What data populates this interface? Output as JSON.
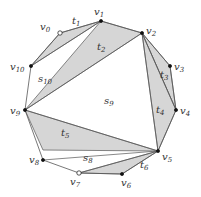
{
  "diagram": {
    "vertices": [
      {
        "id": "v0",
        "label": "v",
        "sub": "0",
        "x": 60,
        "y": 33,
        "open": true,
        "lx": 40,
        "ly": 30
      },
      {
        "id": "v1",
        "label": "v",
        "sub": "1",
        "x": 101,
        "y": 21,
        "open": false,
        "lx": 94,
        "ly": 15
      },
      {
        "id": "v2",
        "label": "v",
        "sub": "2",
        "x": 142,
        "y": 33,
        "open": false,
        "lx": 146,
        "ly": 34
      },
      {
        "id": "v3",
        "label": "v",
        "sub": "3",
        "x": 170,
        "y": 66,
        "open": false,
        "lx": 174,
        "ly": 70
      },
      {
        "id": "v4",
        "label": "v",
        "sub": "4",
        "x": 176,
        "y": 110,
        "open": false,
        "lx": 180,
        "ly": 114
      },
      {
        "id": "v5",
        "label": "v",
        "sub": "5",
        "x": 158,
        "y": 151,
        "open": false,
        "lx": 162,
        "ly": 160
      },
      {
        "id": "v6",
        "label": "v",
        "sub": "6",
        "x": 122,
        "y": 174,
        "open": false,
        "lx": 121,
        "ly": 186
      },
      {
        "id": "v7",
        "label": "v",
        "sub": "7",
        "x": 79,
        "y": 173,
        "open": true,
        "lx": 70,
        "ly": 185
      },
      {
        "id": "v8",
        "label": "v",
        "sub": "8",
        "x": 43,
        "y": 160,
        "open": false,
        "lx": 29,
        "ly": 163
      },
      {
        "id": "v9",
        "label": "v",
        "sub": "9",
        "x": 25,
        "y": 110,
        "open": false,
        "lx": 10,
        "ly": 114
      },
      {
        "id": "v10",
        "label": "v",
        "sub": "10",
        "x": 31,
        "y": 66,
        "open": false,
        "lx": 10,
        "ly": 70
      }
    ],
    "shaded_triangles": [
      {
        "name": "t1",
        "pts": "60,33 101,21 31,66",
        "label": "t",
        "sub": "1",
        "lx": 72,
        "ly": 24
      },
      {
        "name": "t2",
        "pts": "101,21 142,33 25,110",
        "label": "t",
        "sub": "2",
        "lx": 97,
        "ly": 50
      },
      {
        "name": "t3",
        "pts": "142,33 170,66 176,110",
        "label": "t",
        "sub": "3",
        "lx": 160,
        "ly": 78
      },
      {
        "name": "t4",
        "pts": "142,33 176,110 158,151",
        "label": "t",
        "sub": "4",
        "lx": 156,
        "ly": 113
      },
      {
        "name": "t5",
        "pts": "25,110 158,151 43,150",
        "label": "t",
        "sub": "5",
        "lx": 61,
        "ly": 136
      },
      {
        "name": "t6",
        "pts": "158,151 122,174 79,173",
        "label": "t",
        "sub": "6",
        "lx": 140,
        "ly": 168
      }
    ],
    "region_labels": [
      {
        "name": "s10",
        "label": "s",
        "sub": "10",
        "x": 38,
        "y": 82
      },
      {
        "name": "s9",
        "label": "s",
        "sub": "9",
        "x": 104,
        "y": 104
      },
      {
        "name": "s8",
        "label": "s",
        "sub": "8",
        "x": 83,
        "y": 161
      }
    ],
    "colors": {
      "shade": "#d6d6d6",
      "stroke": "#555555",
      "vertex": "#111111"
    }
  }
}
